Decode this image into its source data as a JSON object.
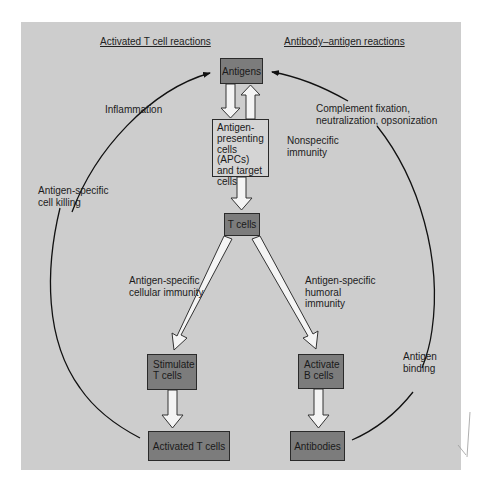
{
  "headers": {
    "left": "Activated T cell reactions",
    "right": "Antibody–antigen reactions"
  },
  "nodes": {
    "antigens": "Antigens",
    "apc_lines": [
      "Antigen-",
      "presenting",
      "cells (APCs)",
      "and target",
      "cells"
    ],
    "t_cells": "T cells",
    "stimulate_lines": [
      "Stimulate",
      "T cells"
    ],
    "activate_lines": [
      "Activate",
      "B cells"
    ],
    "activated_t_cells": "Activated T cells",
    "antibodies": "Antibodies"
  },
  "labels": {
    "inflammation": "Inflammation",
    "cell_killing_lines": [
      "Antigen-specific",
      "cell killing"
    ],
    "complement_lines": [
      "Complement fixation,",
      "neutralization, opsonization"
    ],
    "nonspecific_lines": [
      "Nonspecific",
      "immunity"
    ],
    "cellular_lines": [
      "Antigen-specific",
      "cellular immunity"
    ],
    "humoral_lines": [
      "Antigen-specific",
      "humoral",
      "immunity"
    ],
    "binding_lines": [
      "Antigen",
      "binding"
    ]
  },
  "colors": {
    "panel_bg": "#cdcdcd",
    "dark_box": "#7c7c7c",
    "light_box": "#d4d4d4",
    "arrow_fill": "#f4f4f4",
    "line": "#111111"
  }
}
